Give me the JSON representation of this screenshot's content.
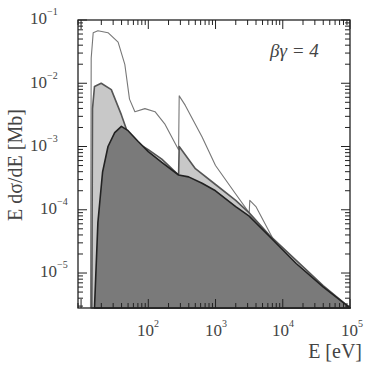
{
  "chart_data": {
    "type": "area",
    "title": "",
    "xlabel": "E [eV]",
    "ylabel": "E dσ/dE [Mb]",
    "xscale": "log",
    "yscale": "log",
    "xlim": [
      9,
      100000
    ],
    "ylim": [
      2.8e-06,
      0.1
    ],
    "grid": false,
    "annotation": "βγ = 4",
    "x_ticks": [
      {
        "base": "10",
        "exp": "2",
        "value": 100
      },
      {
        "base": "10",
        "exp": "3",
        "value": 1000
      },
      {
        "base": "10",
        "exp": "4",
        "value": 10000
      },
      {
        "base": "10",
        "exp": "5",
        "value": 100000
      }
    ],
    "y_ticks": [
      {
        "base": "10",
        "exp": "−1",
        "value": 0.1
      },
      {
        "base": "10",
        "exp": "−2",
        "value": 0.01
      },
      {
        "base": "10",
        "exp": "−3",
        "value": 0.001
      },
      {
        "base": "10",
        "exp": "−4",
        "value": 0.0001
      },
      {
        "base": "10",
        "exp": "−5",
        "value": 1e-05
      }
    ],
    "series": [
      {
        "name": "outer envelope (white, thin line)",
        "fill": "#ffffff",
        "stroke": "#777777",
        "points_log10": [
          [
            1.14,
            -5.55
          ],
          [
            1.15,
            -1.6
          ],
          [
            1.18,
            -1.2
          ],
          [
            1.25,
            -1.17
          ],
          [
            1.4,
            -1.2
          ],
          [
            1.55,
            -1.35
          ],
          [
            1.65,
            -1.7
          ],
          [
            1.72,
            -2.25
          ],
          [
            1.8,
            -2.45
          ],
          [
            1.95,
            -2.4
          ],
          [
            2.1,
            -2.45
          ],
          [
            2.25,
            -2.65
          ],
          [
            2.4,
            -2.95
          ],
          [
            2.45,
            -3.05
          ],
          [
            2.46,
            -2.2
          ],
          [
            2.55,
            -2.35
          ],
          [
            2.8,
            -2.85
          ],
          [
            3.0,
            -3.3
          ],
          [
            3.3,
            -3.75
          ],
          [
            3.5,
            -4.05
          ],
          [
            3.51,
            -3.85
          ],
          [
            3.6,
            -3.95
          ],
          [
            3.9,
            -4.55
          ],
          [
            4.3,
            -5.0
          ],
          [
            4.7,
            -5.4
          ],
          [
            5.0,
            -5.55
          ]
        ]
      },
      {
        "name": "middle (light gray)",
        "fill": "#c8c8c8",
        "stroke": "#555555",
        "points_log10": [
          [
            1.16,
            -5.55
          ],
          [
            1.17,
            -2.4
          ],
          [
            1.2,
            -2.05
          ],
          [
            1.3,
            -2.0
          ],
          [
            1.45,
            -2.1
          ],
          [
            1.6,
            -2.5
          ],
          [
            1.7,
            -2.8
          ],
          [
            1.85,
            -2.95
          ],
          [
            2.0,
            -3.05
          ],
          [
            2.2,
            -3.2
          ],
          [
            2.45,
            -3.45
          ],
          [
            2.46,
            -3.0
          ],
          [
            2.7,
            -3.35
          ],
          [
            3.0,
            -3.6
          ],
          [
            3.3,
            -3.85
          ],
          [
            3.5,
            -4.05
          ],
          [
            3.8,
            -4.4
          ],
          [
            4.2,
            -4.8
          ],
          [
            4.6,
            -5.2
          ],
          [
            5.0,
            -5.55
          ]
        ]
      },
      {
        "name": "inner (dark gray)",
        "fill": "#7a7a7a",
        "stroke": "#222222",
        "points_log10": [
          [
            1.2,
            -5.55
          ],
          [
            1.25,
            -4.2
          ],
          [
            1.32,
            -3.4
          ],
          [
            1.4,
            -3.0
          ],
          [
            1.5,
            -2.78
          ],
          [
            1.6,
            -2.68
          ],
          [
            1.7,
            -2.75
          ],
          [
            1.85,
            -2.92
          ],
          [
            2.0,
            -3.08
          ],
          [
            2.2,
            -3.25
          ],
          [
            2.45,
            -3.45
          ],
          [
            2.6,
            -3.48
          ],
          [
            2.8,
            -3.58
          ],
          [
            3.0,
            -3.7
          ],
          [
            3.3,
            -3.95
          ],
          [
            3.5,
            -4.1
          ],
          [
            3.8,
            -4.42
          ],
          [
            4.2,
            -4.85
          ],
          [
            4.6,
            -5.22
          ],
          [
            5.0,
            -5.55
          ]
        ]
      }
    ]
  }
}
